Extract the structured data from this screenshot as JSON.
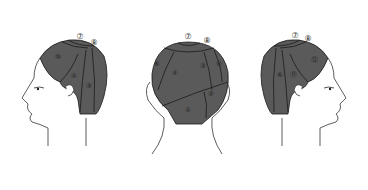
{
  "diagram": {
    "type": "hair-sectioning-diagram",
    "colors": {
      "hair": "#5a5a5a",
      "line": "#1a1a1a",
      "skin_outline": "#333333",
      "background": "#ffffff"
    },
    "views": [
      {
        "name": "left-profile",
        "labels": {
          "top_a": "⑦",
          "top_b": "⑧",
          "front": "⑩",
          "mid": "④",
          "back": "③"
        }
      },
      {
        "name": "back-view",
        "labels": {
          "top_a": "⑦",
          "top_b": "⑧",
          "left": "⑥",
          "upper_left": "④",
          "upper_right": "③",
          "right": "⑤",
          "lower_right": "②",
          "bottom": "①"
        }
      },
      {
        "name": "right-profile",
        "labels": {
          "top_a": "⑦",
          "top_b": "⑧",
          "front": "⑫",
          "mid": "⑪",
          "back": "⑥"
        }
      }
    ]
  }
}
